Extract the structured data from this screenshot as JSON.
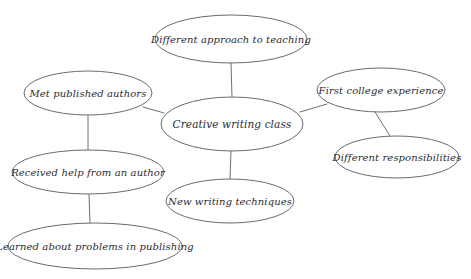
{
  "diagram": {
    "type": "concept-map",
    "background_color": "#ffffff",
    "node_stroke_color": "#6b6b70",
    "edge_stroke_color": "#6f6f72",
    "text_color": "#2b2b30",
    "nodes": [
      {
        "id": "creative-writing-class",
        "label": "Creative writing class",
        "role": "center",
        "cx": 232,
        "cy": 124,
        "rx": 71,
        "ry": 27,
        "font_size": 10.5
      },
      {
        "id": "different-approach-to-teaching",
        "label": "Different approach to teaching",
        "role": "branch",
        "cx": 231,
        "cy": 39,
        "rx": 76,
        "ry": 24,
        "font_size": 10
      },
      {
        "id": "met-published-authors",
        "label": "Met published authors",
        "role": "branch",
        "cx": 88,
        "cy": 93,
        "rx": 64,
        "ry": 22,
        "font_size": 10
      },
      {
        "id": "first-college-experience",
        "label": "First college experience",
        "role": "branch",
        "cx": 381,
        "cy": 90,
        "rx": 64,
        "ry": 22,
        "font_size": 10
      },
      {
        "id": "different-responsibilities",
        "label": "Different responsibilities",
        "role": "branch",
        "cx": 397,
        "cy": 157,
        "rx": 62,
        "ry": 21,
        "font_size": 10
      },
      {
        "id": "received-help-from-an-author",
        "label": "Received help from an author",
        "role": "branch",
        "cx": 88,
        "cy": 172,
        "rx": 76,
        "ry": 22,
        "font_size": 10
      },
      {
        "id": "learned-about-problems-in-publishing",
        "label": "Learned about problems in publishing",
        "role": "branch",
        "cx": 95,
        "cy": 246,
        "rx": 87,
        "ry": 23,
        "font_size": 10
      },
      {
        "id": "new-writing-techniques",
        "label": "New writing techniques",
        "role": "branch",
        "cx": 230,
        "cy": 201,
        "rx": 64,
        "ry": 22,
        "font_size": 10
      }
    ],
    "edges": [
      {
        "id": "edge-center-to-teaching",
        "from": "creative-writing-class",
        "to": "different-approach-to-teaching",
        "x1": 232,
        "y1": 97,
        "x2": 231,
        "y2": 63
      },
      {
        "id": "edge-center-to-authors",
        "from": "creative-writing-class",
        "to": "met-published-authors",
        "x1": 164,
        "y1": 113,
        "x2": 143,
        "y2": 107
      },
      {
        "id": "edge-center-to-college",
        "from": "creative-writing-class",
        "to": "first-college-experience",
        "x1": 300,
        "y1": 112,
        "x2": 327,
        "y2": 104
      },
      {
        "id": "edge-center-to-techniques",
        "from": "creative-writing-class",
        "to": "new-writing-techniques",
        "x1": 231,
        "y1": 151,
        "x2": 230,
        "y2": 179
      },
      {
        "id": "edge-college-to-responsibilities",
        "from": "first-college-experience",
        "to": "different-responsibilities",
        "x1": 375,
        "y1": 112,
        "x2": 390,
        "y2": 136
      },
      {
        "id": "edge-authors-to-help",
        "from": "met-published-authors",
        "to": "received-help-from-an-author",
        "x1": 88,
        "y1": 115,
        "x2": 88,
        "y2": 150
      },
      {
        "id": "edge-help-to-publishing",
        "from": "received-help-from-an-author",
        "to": "learned-about-problems-in-publishing",
        "x1": 89,
        "y1": 194,
        "x2": 90,
        "y2": 223
      }
    ]
  }
}
